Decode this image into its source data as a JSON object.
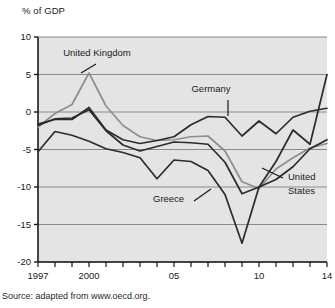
{
  "figure": {
    "axis_title": "% of GDP",
    "source_note": "Source: adapted from www.oecd.org.",
    "plot_bg": "#e4e4e4",
    "grid_color": "#8a8a8a",
    "axis_color": "#1a1a1a",
    "dark_line_color": "#2b2b2b",
    "light_line_color": "#8e8e8e"
  },
  "chart_data": {
    "type": "line",
    "title": "",
    "subtitle": "",
    "xlabel": "",
    "ylabel": "% of GDP",
    "ylim": [
      -20,
      10
    ],
    "xlim": [
      1997,
      2014
    ],
    "yticks": [
      10,
      5,
      0,
      -5,
      -10,
      -15,
      -20
    ],
    "ytick_labels": [
      "10",
      "5",
      "0",
      "-5",
      "-10",
      "-15",
      "-20"
    ],
    "xticks": [
      1997,
      1998,
      1999,
      2000,
      2001,
      2002,
      2003,
      2004,
      2005,
      2006,
      2007,
      2008,
      2009,
      2010,
      2011,
      2012,
      2013,
      2014
    ],
    "xtick_labels": {
      "1997": "1997",
      "2000": "2000",
      "2005": "05",
      "2010": "10",
      "2014": "14"
    },
    "grid": true,
    "legend": "annotations",
    "x": [
      1997,
      1998,
      1999,
      2000,
      2001,
      2002,
      2003,
      2004,
      2005,
      2006,
      2007,
      2008,
      2009,
      2010,
      2011,
      2012,
      2013,
      2014
    ],
    "series": [
      {
        "name": "United Kingdom",
        "color": "#8e8e8e",
        "label_anchor": {
          "x": 2000,
          "y": 5.2
        },
        "values": [
          -2.0,
          -0.2,
          1.0,
          5.2,
          0.8,
          -1.8,
          -3.3,
          -3.8,
          -3.7,
          -3.3,
          -3.2,
          -5.2,
          -9.3,
          -10.2,
          -7.6,
          -6.1,
          -4.8,
          -4.2
        ]
      },
      {
        "name": "Germany",
        "color": "#2b2b2b",
        "label_anchor": {
          "x": 2008,
          "y": -1.2
        },
        "values": [
          -1.6,
          -1.0,
          -1.0,
          0.6,
          -2.4,
          -3.7,
          -4.2,
          -3.8,
          -3.3,
          -1.7,
          -0.6,
          -0.7,
          -3.2,
          -1.2,
          -2.9,
          -0.7,
          0.1,
          0.5
        ]
      },
      {
        "name": "United States",
        "color": "#2b2b2b",
        "label_anchor": {
          "x": 2011.8,
          "y": -9.3
        },
        "values": [
          -1.8,
          -0.9,
          -0.8,
          0.3,
          -2.5,
          -4.4,
          -5.2,
          -4.6,
          -4.0,
          -4.1,
          -4.3,
          -6.7,
          -10.9,
          -10.0,
          -9.0,
          -7.3,
          -4.9,
          -3.7
        ]
      },
      {
        "name": "Greece",
        "color": "#2b2b2b",
        "label_anchor": {
          "x": 2005.8,
          "y": -12.4
        },
        "values": [
          -5.3,
          -2.6,
          -3.1,
          -3.9,
          -4.9,
          -5.4,
          -6.1,
          -8.9,
          -6.4,
          -6.6,
          -7.8,
          -11.0,
          -17.5,
          -10.0,
          -6.6,
          -2.4,
          -4.3,
          5.0
        ]
      }
    ],
    "annotations": [
      {
        "text": "United Kingdom",
        "x": 97,
        "y": 56
      },
      {
        "text": "Germany",
        "x": 211,
        "y": 92
      },
      {
        "text": "Greece",
        "x": 153,
        "y": 202
      },
      {
        "text": "United",
        "x": 288,
        "y": 180
      },
      {
        "text": "States",
        "x": 288,
        "y": 194
      }
    ]
  }
}
